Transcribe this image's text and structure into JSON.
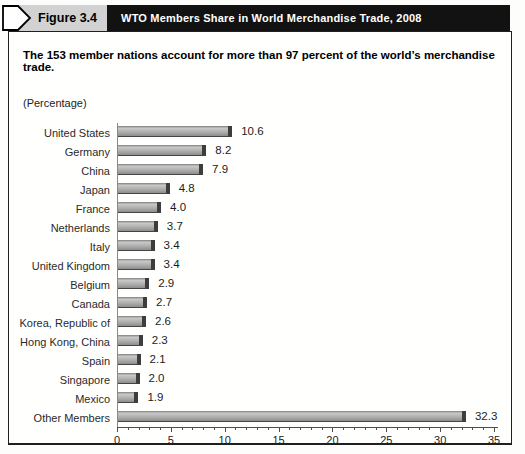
{
  "header": {
    "figure_label": "Figure 3.4",
    "title": "WTO Members Share in World Merchandise Trade, 2008"
  },
  "subtitle": "The 153 member nations account for more than 97 percent of the world’s merchandise trade.",
  "unit_label": "(Percentage)",
  "colors": {
    "header_bar": "#121212",
    "figure_tab_bg": "#d2d2d2",
    "bar_fill": "#adadad",
    "bar_fill_light": "#c9c9c9",
    "bar_fill_dark": "#8d8d8d",
    "bar_cap": "#3d3d3d",
    "axis_line": "#4d4d4d"
  },
  "chart_data": {
    "type": "bar",
    "orientation": "horizontal",
    "title": "WTO Members Share in World Merchandise Trade, 2008",
    "xlabel": "(Percentage)",
    "ylabel": "",
    "categories": [
      "United States",
      "Germany",
      "China",
      "Japan",
      "France",
      "Netherlands",
      "Italy",
      "United Kingdom",
      "Belgium",
      "Canada",
      "Korea, Republic of",
      "Hong Kong, China",
      "Spain",
      "Singapore",
      "Mexico",
      "Other Members"
    ],
    "values": [
      10.6,
      8.2,
      7.9,
      4.8,
      4.0,
      3.7,
      3.4,
      3.4,
      2.9,
      2.7,
      2.6,
      2.3,
      2.1,
      2.0,
      1.9,
      32.3
    ],
    "value_labels": [
      "10.6",
      "8.2",
      "7.9",
      "4.8",
      "4.0",
      "3.7",
      "3.4",
      "3.4",
      "2.9",
      "2.7",
      "2.6",
      "2.3",
      "2.1",
      "2.0",
      "1.9",
      "32.3"
    ],
    "xlim": [
      0,
      35
    ],
    "xticks": [
      0,
      5,
      10,
      15,
      20,
      25,
      30,
      35
    ],
    "minor_tick_step": 1,
    "grid": false,
    "legend": false
  }
}
